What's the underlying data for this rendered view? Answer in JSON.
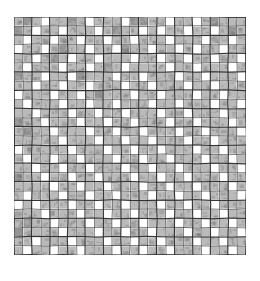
{
  "document": {
    "title": "Grid Pattern Chart",
    "description": "Scanned hand-drawn square grid chart with shaded cells forming diagonal lattice motifs"
  },
  "chart_data": {
    "type": "heatmap",
    "title": "",
    "subtitle": "",
    "xlabel": "",
    "ylabel": "",
    "grid": true,
    "legend_position": "none",
    "rows": 26,
    "cols": 26,
    "x": [
      1,
      2,
      3,
      4,
      5,
      6,
      7,
      8,
      9,
      10,
      11,
      12,
      13,
      14,
      15,
      16,
      17,
      18,
      19,
      20,
      21,
      22,
      23,
      24,
      25,
      26
    ],
    "y": [
      1,
      2,
      3,
      4,
      5,
      6,
      7,
      8,
      9,
      10,
      11,
      12,
      13,
      14,
      15,
      16,
      17,
      18,
      19,
      20,
      21,
      22,
      23,
      24,
      25,
      26
    ],
    "xtick_labels": [],
    "ytick_labels": [],
    "value_levels": [
      0,
      1,
      2
    ],
    "level_colors": [
      "#ffffff",
      "#b4b4b4",
      "#8c8c8c"
    ],
    "annotations": [],
    "values": [
      [
        1,
        2,
        1,
        0,
        1,
        1,
        2,
        1,
        0,
        1,
        1,
        1,
        0,
        2,
        2,
        1,
        1,
        0,
        1,
        1,
        0,
        1,
        2,
        1,
        1,
        1
      ],
      [
        2,
        1,
        0,
        1,
        1,
        0,
        1,
        1,
        1,
        0,
        1,
        2,
        1,
        1,
        0,
        1,
        0,
        1,
        1,
        0,
        1,
        1,
        0,
        1,
        2,
        1
      ],
      [
        1,
        0,
        1,
        1,
        0,
        1,
        1,
        0,
        1,
        1,
        0,
        1,
        1,
        0,
        1,
        1,
        1,
        0,
        1,
        1,
        1,
        0,
        1,
        1,
        0,
        1
      ],
      [
        0,
        1,
        1,
        0,
        1,
        2,
        1,
        1,
        0,
        1,
        1,
        0,
        2,
        1,
        1,
        0,
        1,
        1,
        0,
        1,
        0,
        1,
        1,
        0,
        1,
        1
      ],
      [
        1,
        1,
        0,
        1,
        2,
        1,
        0,
        1,
        1,
        0,
        1,
        1,
        1,
        0,
        1,
        1,
        0,
        1,
        1,
        0,
        1,
        1,
        0,
        1,
        1,
        0
      ],
      [
        1,
        0,
        1,
        1,
        1,
        0,
        1,
        1,
        0,
        1,
        2,
        1,
        0,
        1,
        1,
        1,
        1,
        0,
        1,
        1,
        0,
        1,
        1,
        1,
        0,
        1
      ],
      [
        2,
        1,
        1,
        0,
        1,
        1,
        0,
        2,
        1,
        1,
        1,
        0,
        1,
        1,
        0,
        1,
        1,
        1,
        0,
        1,
        1,
        0,
        1,
        1,
        1,
        0
      ],
      [
        1,
        1,
        0,
        1,
        1,
        0,
        1,
        1,
        0,
        1,
        1,
        1,
        0,
        1,
        1,
        0,
        1,
        1,
        1,
        0,
        1,
        1,
        0,
        1,
        1,
        1
      ],
      [
        0,
        1,
        1,
        1,
        0,
        1,
        1,
        0,
        1,
        2,
        1,
        1,
        1,
        0,
        1,
        1,
        0,
        1,
        1,
        1,
        0,
        1,
        1,
        0,
        1,
        1
      ],
      [
        1,
        0,
        1,
        1,
        1,
        0,
        1,
        1,
        0,
        1,
        1,
        0,
        1,
        1,
        1,
        0,
        1,
        1,
        0,
        1,
        1,
        1,
        0,
        1,
        1,
        0
      ],
      [
        1,
        1,
        0,
        1,
        1,
        1,
        0,
        1,
        1,
        0,
        1,
        1,
        0,
        1,
        1,
        1,
        0,
        1,
        1,
        0,
        1,
        1,
        1,
        0,
        1,
        1
      ],
      [
        2,
        1,
        1,
        0,
        1,
        1,
        1,
        0,
        1,
        1,
        0,
        1,
        1,
        0,
        1,
        1,
        1,
        0,
        1,
        1,
        0,
        1,
        1,
        1,
        0,
        1
      ],
      [
        1,
        2,
        1,
        1,
        0,
        1,
        1,
        1,
        0,
        1,
        1,
        0,
        1,
        1,
        0,
        1,
        1,
        1,
        0,
        1,
        1,
        0,
        1,
        1,
        1,
        0
      ],
      [
        1,
        1,
        1,
        1,
        1,
        0,
        1,
        1,
        1,
        0,
        1,
        1,
        0,
        1,
        1,
        0,
        1,
        1,
        1,
        0,
        1,
        1,
        0,
        1,
        1,
        1
      ],
      [
        0,
        1,
        1,
        1,
        1,
        1,
        0,
        1,
        1,
        1,
        0,
        1,
        1,
        0,
        1,
        1,
        0,
        1,
        1,
        1,
        0,
        1,
        1,
        0,
        1,
        1
      ],
      [
        1,
        0,
        1,
        1,
        0,
        1,
        1,
        0,
        1,
        1,
        1,
        0,
        1,
        1,
        0,
        1,
        1,
        0,
        1,
        1,
        1,
        0,
        1,
        1,
        0,
        1
      ],
      [
        1,
        1,
        0,
        1,
        1,
        0,
        1,
        1,
        0,
        1,
        1,
        1,
        0,
        1,
        1,
        0,
        1,
        1,
        0,
        1,
        1,
        1,
        0,
        1,
        1,
        0
      ],
      [
        2,
        1,
        1,
        0,
        1,
        1,
        0,
        1,
        1,
        0,
        1,
        1,
        1,
        0,
        1,
        1,
        0,
        1,
        1,
        0,
        1,
        1,
        1,
        0,
        1,
        1
      ],
      [
        1,
        1,
        1,
        1,
        0,
        1,
        1,
        0,
        1,
        1,
        0,
        1,
        1,
        1,
        0,
        1,
        1,
        0,
        1,
        1,
        0,
        1,
        1,
        1,
        0,
        1
      ],
      [
        1,
        0,
        1,
        1,
        1,
        0,
        1,
        1,
        0,
        1,
        1,
        0,
        1,
        1,
        1,
        0,
        1,
        1,
        0,
        1,
        1,
        0,
        1,
        1,
        1,
        0
      ],
      [
        0,
        1,
        0,
        1,
        1,
        1,
        0,
        1,
        1,
        0,
        1,
        1,
        0,
        1,
        1,
        1,
        0,
        1,
        1,
        0,
        1,
        1,
        0,
        1,
        1,
        1
      ],
      [
        1,
        1,
        1,
        0,
        1,
        1,
        1,
        0,
        1,
        1,
        0,
        1,
        1,
        0,
        1,
        1,
        1,
        0,
        1,
        1,
        0,
        1,
        1,
        0,
        1,
        1
      ],
      [
        1,
        2,
        1,
        1,
        0,
        1,
        1,
        1,
        0,
        1,
        1,
        0,
        1,
        1,
        0,
        1,
        1,
        1,
        0,
        1,
        1,
        0,
        1,
        1,
        0,
        1
      ],
      [
        2,
        1,
        1,
        1,
        1,
        0,
        1,
        1,
        1,
        0,
        1,
        1,
        0,
        1,
        1,
        0,
        1,
        1,
        1,
        0,
        1,
        1,
        0,
        1,
        1,
        0
      ],
      [
        1,
        1,
        0,
        1,
        1,
        1,
        0,
        1,
        1,
        1,
        0,
        1,
        1,
        0,
        1,
        1,
        0,
        1,
        1,
        1,
        0,
        1,
        1,
        0,
        1,
        1
      ],
      [
        1,
        0,
        1,
        1,
        0,
        1,
        1,
        0,
        1,
        1,
        1,
        0,
        1,
        1,
        0,
        1,
        1,
        0,
        1,
        1,
        1,
        0,
        1,
        1,
        0,
        1
      ]
    ]
  },
  "style": {
    "background_color": "#ffffff",
    "gridline_color": "#2b2b2b",
    "gridline_width_px": 1,
    "cell_size_px": 8.92,
    "origin_x_px": 14,
    "origin_y_px": 17,
    "ink_color": "#3a3a3a"
  }
}
